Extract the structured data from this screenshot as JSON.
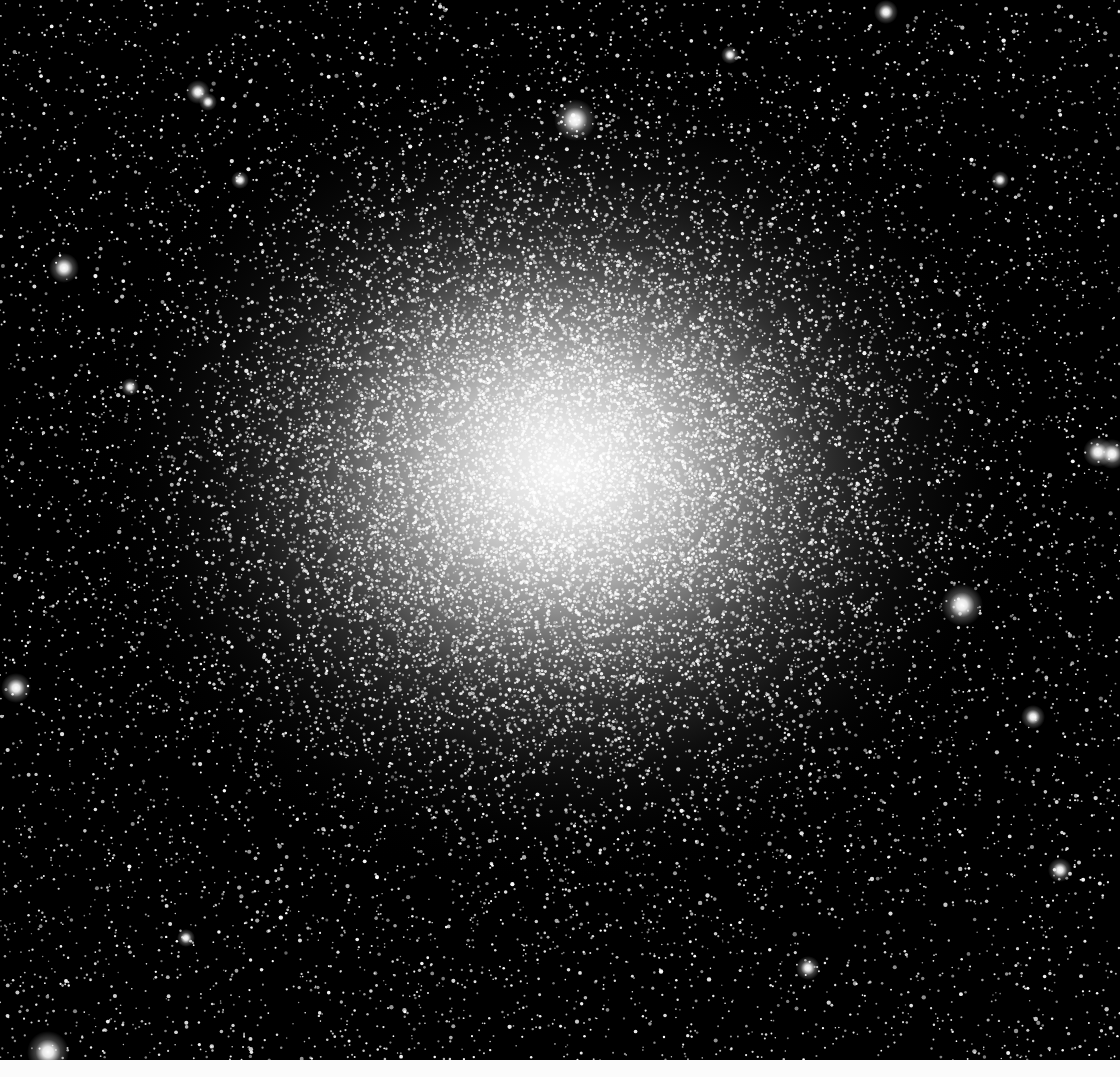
{
  "image": {
    "subject": "globular star cluster",
    "width": 1120,
    "height": 1077,
    "sky_height": 1060,
    "colors": {
      "sky": "#000000",
      "core": "#f2f2f2",
      "bottom_strip": "#fbfbfb"
    },
    "cluster": {
      "center_x": 560,
      "center_y": 470,
      "radius_x": 480,
      "radius_y": 420,
      "core_radius": 130
    },
    "bright_stars": [
      {
        "x": 575,
        "y": 120,
        "r": 7
      },
      {
        "x": 962,
        "y": 605,
        "r": 7
      },
      {
        "x": 48,
        "y": 1052,
        "r": 7
      },
      {
        "x": 16,
        "y": 688,
        "r": 5
      },
      {
        "x": 64,
        "y": 268,
        "r": 5
      },
      {
        "x": 198,
        "y": 92,
        "r": 4
      },
      {
        "x": 208,
        "y": 102,
        "r": 3
      },
      {
        "x": 1098,
        "y": 452,
        "r": 5
      },
      {
        "x": 1112,
        "y": 454,
        "r": 5
      },
      {
        "x": 1033,
        "y": 717,
        "r": 4
      },
      {
        "x": 1060,
        "y": 870,
        "r": 4
      },
      {
        "x": 130,
        "y": 387,
        "r": 3
      },
      {
        "x": 808,
        "y": 968,
        "r": 4
      },
      {
        "x": 186,
        "y": 938,
        "r": 3
      },
      {
        "x": 886,
        "y": 12,
        "r": 4
      },
      {
        "x": 730,
        "y": 55,
        "r": 3
      },
      {
        "x": 240,
        "y": 180,
        "r": 3
      },
      {
        "x": 1000,
        "y": 180,
        "r": 3
      }
    ],
    "field_star_count": 9000,
    "cluster_star_count": 16000
  }
}
